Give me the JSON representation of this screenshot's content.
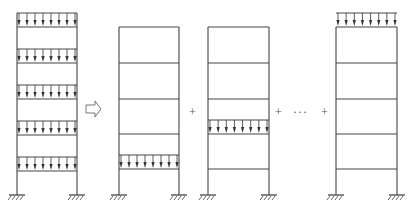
{
  "diagram": {
    "colors": {
      "line": "#444444",
      "load": "#333333",
      "operator": "#666666"
    },
    "columns_per_frame": 2,
    "storeys": 5,
    "operators": {
      "equivalence_arrow": "⇨",
      "plus_1": "+",
      "plus_2": "+",
      "ellipsis": "···",
      "plus_3": "+"
    },
    "frames": [
      {
        "name": "full-load-frame",
        "x_left": 17,
        "x_right": 77,
        "loaded_floors": [
          1,
          2,
          3,
          4,
          5
        ]
      },
      {
        "name": "load-case-floor-1",
        "x_left": 119,
        "x_right": 179,
        "loaded_floors": [
          1
        ]
      },
      {
        "name": "load-case-floor-2",
        "x_left": 208,
        "x_right": 269,
        "loaded_floors": [
          2
        ]
      },
      {
        "name": "load-case-top-floor",
        "x_left": 336,
        "x_right": 397,
        "loaded_floors": [
          5
        ]
      }
    ]
  }
}
